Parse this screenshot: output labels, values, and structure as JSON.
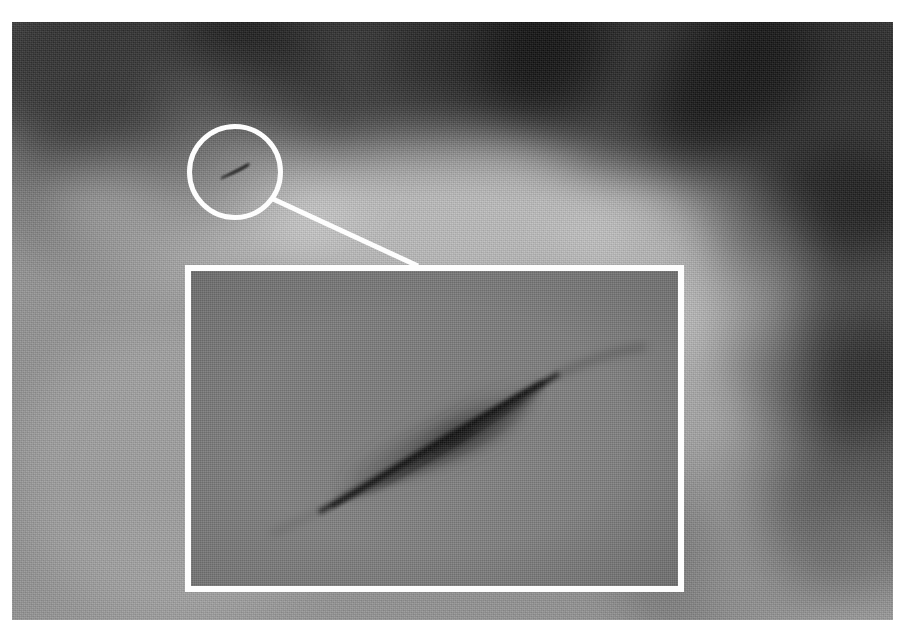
{
  "image": {
    "kind": "photograph",
    "subject": "dark wedge-shaped object in cloudy sky",
    "color_mode": "grayscale",
    "plate_border_color": "#ffffff",
    "annotation_color": "#fdfdfd"
  },
  "annotations": {
    "circle_callout": {
      "name": "circle-callout",
      "shape": "circle",
      "stroke_color": "#fdfdfd",
      "stroke_width_px": 5,
      "center_x": 235,
      "center_y": 172,
      "radius_px": 48
    },
    "leader_line": {
      "name": "leader-line",
      "stroke_color": "#fdfdfd",
      "stroke_width_px": 5,
      "from_x": 273,
      "from_y": 199,
      "to_x": 418,
      "to_y": 266
    },
    "inset_panel": {
      "name": "magnified-inset",
      "shape": "rectangle",
      "stroke_color": "#fdfdfd",
      "stroke_width_px": 6,
      "x": 185,
      "y": 265,
      "width": 499,
      "height": 327
    },
    "object_small": {
      "name": "sky-object",
      "x": 216,
      "y": 160,
      "width": 40,
      "height": 22,
      "fill_color": "#3a3a3a"
    }
  },
  "sky": {
    "clouds_dark": [
      {
        "x": -40,
        "y": -60,
        "w": 340,
        "h": 210,
        "tone": "#4a4a4a",
        "alpha": 0.72
      },
      {
        "x": 180,
        "y": -90,
        "w": 420,
        "h": 220,
        "tone": "#4f4f4f",
        "alpha": 0.7
      },
      {
        "x": 470,
        "y": -80,
        "w": 330,
        "h": 230,
        "tone": "#474747",
        "alpha": 0.74
      },
      {
        "x": 640,
        "y": -40,
        "w": 330,
        "h": 280,
        "tone": "#3f3f3f",
        "alpha": 0.8
      },
      {
        "x": 700,
        "y": 120,
        "w": 260,
        "h": 300,
        "tone": "#4d4d4d",
        "alpha": 0.74
      },
      {
        "x": 740,
        "y": 300,
        "w": 220,
        "h": 280,
        "tone": "#565656",
        "alpha": 0.58
      },
      {
        "x": -30,
        "y": 90,
        "w": 250,
        "h": 150,
        "tone": "#5e5e5e",
        "alpha": 0.4
      },
      {
        "x": 120,
        "y": 60,
        "w": 230,
        "h": 130,
        "tone": "#636363",
        "alpha": 0.32
      },
      {
        "x": 600,
        "y": 430,
        "w": 240,
        "h": 200,
        "tone": "#6a6a6a",
        "alpha": 0.3
      },
      {
        "x": 380,
        "y": -30,
        "w": 200,
        "h": 120,
        "tone": "#545454",
        "alpha": 0.5
      }
    ],
    "clouds_light": [
      {
        "x": 40,
        "y": 110,
        "w": 300,
        "h": 150,
        "tone": "#c9c9c9",
        "alpha": 0.34
      },
      {
        "x": 250,
        "y": 120,
        "w": 360,
        "h": 160,
        "tone": "#d2d2d2",
        "alpha": 0.4
      },
      {
        "x": 560,
        "y": 150,
        "w": 240,
        "h": 180,
        "tone": "#cdcdcd",
        "alpha": 0.34
      },
      {
        "x": 620,
        "y": 250,
        "w": 180,
        "h": 260,
        "tone": "#c4c4c4",
        "alpha": 0.3
      },
      {
        "x": 0,
        "y": 300,
        "w": 340,
        "h": 300,
        "tone": "#bcbcbc",
        "alpha": 0.22
      },
      {
        "x": 680,
        "y": 480,
        "w": 240,
        "h": 160,
        "tone": "#bdbdbd",
        "alpha": 0.24
      },
      {
        "x": 140,
        "y": 40,
        "w": 160,
        "h": 90,
        "tone": "#b8b8b8",
        "alpha": 0.22
      }
    ]
  }
}
